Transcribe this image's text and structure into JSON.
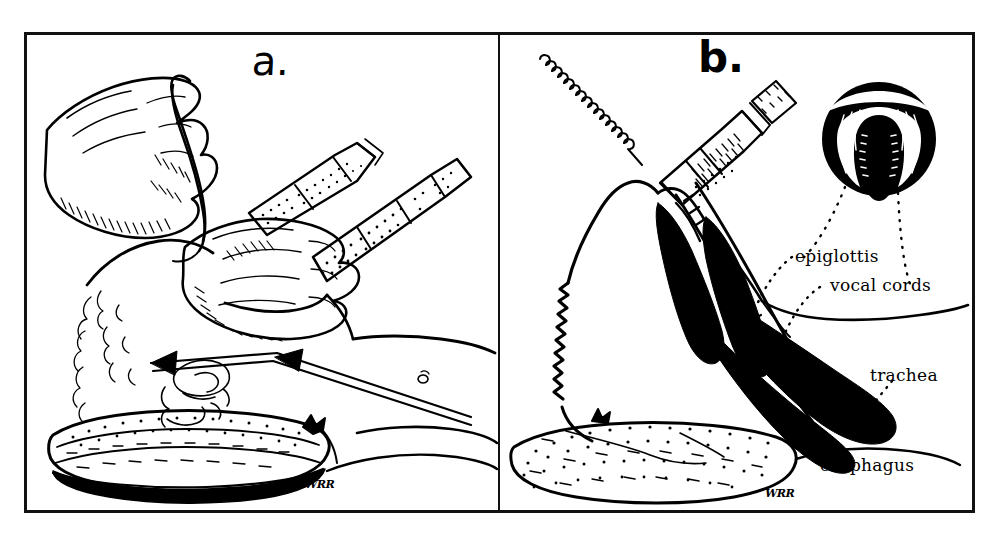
{
  "figure": {
    "kind": "medical line illustration",
    "technique": "pen and ink",
    "artist_signature": "WRR"
  },
  "scan_artifacts": {
    "top_fragment": "",
    "bottom_fragment": ""
  },
  "panels": [
    {
      "id": "a",
      "letter": "a.",
      "caption_letter": "a.",
      "signature": "WRR",
      "elements": [
        "gloved hand holding laryngoscope",
        "gloved hand holding endotracheal tube",
        "patient head extended",
        "patient torso and arm",
        "double-line arrow indicating line of sight",
        "textured log under shoulders"
      ]
    },
    {
      "id": "b",
      "letter": "b.",
      "caption_letter": "b.",
      "signature": "WRR",
      "elements": [
        "sagittal head section",
        "endotracheal tube with connector and pilot balloon",
        "inset circle showing laryngoscopic view of vocal cords",
        "textured log under shoulders",
        "dotted leader lines to labels"
      ],
      "labels": [
        {
          "id": "epiglottis",
          "text": "epiglottis"
        },
        {
          "id": "vocal-cords",
          "text": "vocal cords"
        },
        {
          "id": "trachea",
          "text": "trachea"
        },
        {
          "id": "esophagus",
          "text": "esophagus"
        }
      ]
    }
  ],
  "colors": {
    "ink": "#000000",
    "paper": "#ffffff",
    "scan_ghost": "#c4c4c4"
  }
}
